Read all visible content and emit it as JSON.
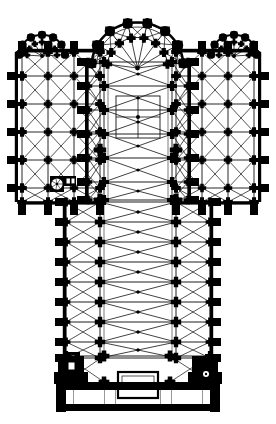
{
  "document": {
    "type": "architectural-floor-plan",
    "subject": "Gothic cathedral ground plan",
    "orientation": "apse at top (east), west front at bottom",
    "render": {
      "background_color": "#ffffff",
      "ink_color": "#000000",
      "line_color": "#111111",
      "width_px": 276,
      "height_px": 424
    }
  },
  "plan": {
    "axis_x": 137.5,
    "parts": [
      {
        "name": "apse-chevet",
        "label": "Apse / Chevet",
        "bbox": [
          96,
          8,
          84,
          60
        ]
      },
      {
        "name": "choir",
        "label": "Choir",
        "bbox": [
          88,
          60,
          100,
          100
        ]
      },
      {
        "name": "crossing",
        "label": "Crossing",
        "bbox": [
          100,
          150,
          76,
          50
        ]
      },
      {
        "name": "north-transept",
        "label": "North Transept Arm",
        "bbox": [
          18,
          52,
          82,
          150
        ]
      },
      {
        "name": "south-transept",
        "label": "South Transept Arm",
        "bbox": [
          176,
          52,
          82,
          150
        ]
      },
      {
        "name": "nave",
        "label": "Nave",
        "bbox": [
          66,
          200,
          144,
          155
        ]
      },
      {
        "name": "west-front",
        "label": "West Front / Towers",
        "bbox": [
          58,
          352,
          160,
          66
        ]
      },
      {
        "name": "portal-central",
        "label": "Central Portal",
        "bbox": [
          118,
          372,
          40,
          26
        ]
      },
      {
        "name": "stair-turret-north",
        "label": "Stair Turret",
        "bbox": [
          50,
          176,
          14,
          16
        ]
      },
      {
        "name": "stair-turret-west",
        "label": "West Stair Turret",
        "bbox": [
          66,
          352,
          14,
          18
        ]
      }
    ],
    "geometry": {
      "apse_center": [
        137.5,
        66
      ],
      "apse_radius_outer": 46,
      "apse_radius_inner": 30,
      "apse_ray_count": 7,
      "nave": {
        "outer_left": 66,
        "outer_right": 210,
        "arcade_left": 100,
        "arcade_right": 176,
        "top": 200,
        "bottom": 358,
        "bay_ys": [
          202,
          222,
          242,
          262,
          282,
          302,
          322,
          342,
          358
        ]
      },
      "choir": {
        "outer_left": 88,
        "outer_right": 188,
        "arcade_left": 104,
        "arcade_right": 172,
        "top": 62,
        "bottom": 200,
        "bay_ys": [
          62,
          86,
          110,
          134,
          158,
          182,
          200
        ]
      },
      "transept_north": {
        "left": 18,
        "right": 100,
        "top": 52,
        "bottom": 202,
        "bay_xs": [
          22,
          48,
          74,
          100
        ],
        "bay_ys": [
          76,
          104,
          132,
          160,
          188
        ]
      },
      "transept_south": {
        "left": 176,
        "right": 258,
        "top": 52,
        "bottom": 202,
        "bay_xs": [
          176,
          202,
          228,
          254
        ],
        "bay_ys": [
          76,
          104,
          132,
          160,
          188
        ]
      },
      "pier_size_major": 9,
      "pier_size_minor": 6.5,
      "buttress_depth": 11,
      "buttress_width": 8
    }
  },
  "legend": {
    "ink_black": "#000000",
    "rib_line": "#111111",
    "paper": "#ffffff"
  }
}
